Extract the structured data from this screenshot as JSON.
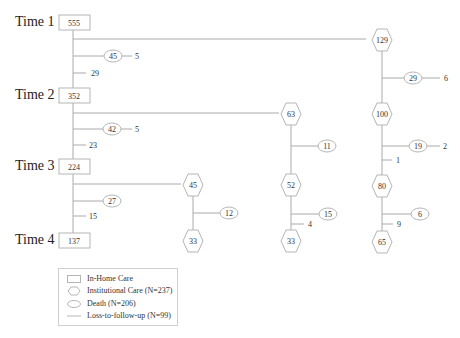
{
  "diagram": {
    "times": [
      {
        "label": "Time 1",
        "in_home": "555"
      },
      {
        "label": "Time 2",
        "in_home": "352"
      },
      {
        "label": "Time 3",
        "in_home": "224"
      },
      {
        "label": "Time 4",
        "in_home": "137"
      }
    ],
    "home_branches": [
      {
        "death": "45",
        "death_loss": "5",
        "loss": "29"
      },
      {
        "death": "42",
        "death_loss": "5",
        "loss": "23"
      },
      {
        "death": "27",
        "loss": "15"
      }
    ],
    "institutional": {
      "col1": {
        "t1": "129",
        "t2": "100",
        "t3": "80",
        "t4": "65",
        "death_1": "29",
        "death_1_loss": "6",
        "death_2": "19",
        "death_2_loss": "2",
        "loss_2": "1",
        "death_3": "6",
        "loss_3": "9"
      },
      "col2": {
        "t2": "63",
        "t3": "52",
        "t4": "33",
        "death_2": "11",
        "death_3": "15",
        "loss_3": "4"
      },
      "col3": {
        "t3": "45",
        "t4": "33",
        "death_3": "12"
      }
    }
  },
  "legend": {
    "in_home": "In-Home Care",
    "institutional": "Institutional Care (N=237)",
    "death": "Death (N=206)",
    "loss": "Loss-to-follow-up (N=99)"
  }
}
